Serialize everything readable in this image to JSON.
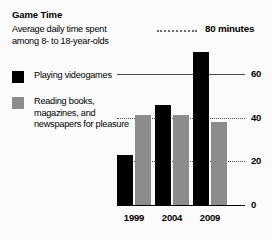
{
  "title": "Game Time",
  "subtitle": "Average daily time spent among 8- to 18-year-olds",
  "legend": {
    "items": [
      {
        "label": "Playing videogames",
        "color": "#000000",
        "swatch_name": "legend-swatch-videogames"
      },
      {
        "label": "Reading books, magazines, and newspapers for pleasure",
        "color": "#8c8c8c",
        "swatch_name": "legend-swatch-reading"
      }
    ]
  },
  "annotation": {
    "label": "80 minutes",
    "value": 80
  },
  "axis": {
    "tick_labels": [
      "0",
      "20",
      "40",
      "60"
    ],
    "tick_values": [
      0,
      20,
      40,
      60
    ]
  },
  "chart_data": {
    "type": "bar",
    "title": "Game Time",
    "subtitle": "Average daily time spent among 8- to 18-year-olds",
    "categories": [
      "1999",
      "2004",
      "2009"
    ],
    "series": [
      {
        "name": "Playing videogames",
        "color": "#000000",
        "values": [
          23,
          46,
          70
        ]
      },
      {
        "name": "Reading books, magazines, and newspapers for pleasure",
        "color": "#8c8c8c",
        "values": [
          41,
          41,
          38
        ]
      }
    ],
    "xlabel": "",
    "ylabel": "minutes",
    "ylim": [
      0,
      84
    ],
    "yticks": [
      0,
      20,
      40,
      60
    ],
    "grid": true,
    "gridlines_dotted": [
      20,
      40
    ],
    "gridlines_solid": [
      60
    ],
    "annotations": [
      {
        "text": "80 minutes",
        "value": 80,
        "style": "dotted-leader"
      }
    ],
    "legend_position": "left"
  }
}
